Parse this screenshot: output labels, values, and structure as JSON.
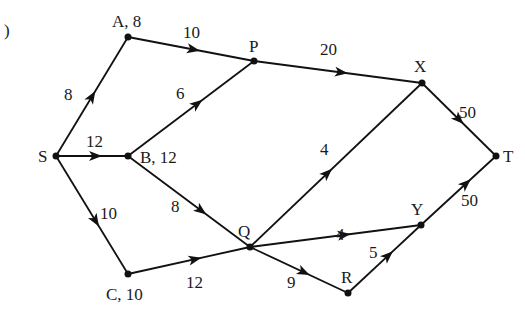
{
  "figure": {
    "corner_mark": ")",
    "type": "directed network with edge weights"
  },
  "nodes": [
    {
      "id": "S",
      "label": "S"
    },
    {
      "id": "A",
      "label": "A, 8"
    },
    {
      "id": "B",
      "label": "B, 12"
    },
    {
      "id": "C",
      "label": "C, 10"
    },
    {
      "id": "P",
      "label": "P"
    },
    {
      "id": "Q",
      "label": "Q"
    },
    {
      "id": "R",
      "label": "R"
    },
    {
      "id": "X",
      "label": "X"
    },
    {
      "id": "Y",
      "label": "Y"
    },
    {
      "id": "T",
      "label": "T"
    }
  ],
  "edges": [
    {
      "from": "S",
      "to": "A",
      "weight": "8"
    },
    {
      "from": "S",
      "to": "B",
      "weight": "12"
    },
    {
      "from": "S",
      "to": "C",
      "weight": "10"
    },
    {
      "from": "A",
      "to": "P",
      "weight": "10"
    },
    {
      "from": "B",
      "to": "P",
      "weight": "6"
    },
    {
      "from": "B",
      "to": "Q",
      "weight": "8"
    },
    {
      "from": "C",
      "to": "Q",
      "weight": "12"
    },
    {
      "from": "P",
      "to": "X",
      "weight": "20"
    },
    {
      "from": "Q",
      "to": "X",
      "weight": "4"
    },
    {
      "from": "Q",
      "to": "Y",
      "weight": "4"
    },
    {
      "from": "Q",
      "to": "R",
      "weight": "9"
    },
    {
      "from": "R",
      "to": "Y",
      "weight": "5"
    },
    {
      "from": "X",
      "to": "T",
      "weight": "50"
    },
    {
      "from": "Y",
      "to": "T",
      "weight": "50"
    }
  ]
}
